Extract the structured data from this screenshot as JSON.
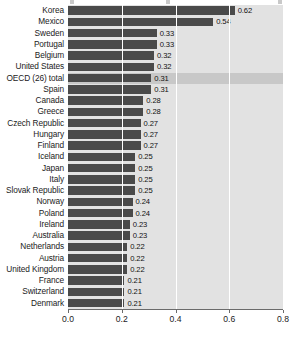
{
  "chart_data": {
    "type": "bar",
    "orientation": "horizontal",
    "title": "",
    "xlabel": "",
    "ylabel": "",
    "xlim": [
      0.0,
      0.8
    ],
    "xticks": [
      "0.0",
      "0.2",
      "0.4",
      "0.6",
      "0.8"
    ],
    "xtick_values": [
      0.0,
      0.2,
      0.4,
      0.6,
      0.8
    ],
    "grid": true,
    "legend": "none",
    "highlight_category": "OECD (26) total",
    "categories": [
      "Korea",
      "Mexico",
      "Sweden",
      "Portugal",
      "Belgium",
      "United States",
      "OECD (26) total",
      "Spain",
      "Canada",
      "Greece",
      "Czech Republic",
      "Hungary",
      "Finland",
      "Iceland",
      "Japan",
      "Italy",
      "Slovak Republic",
      "Norway",
      "Poland",
      "Ireland",
      "Australia",
      "Netherlands",
      "Austria",
      "United Kingdom",
      "France",
      "Switzerland",
      "Denmark"
    ],
    "values": [
      0.62,
      0.54,
      0.33,
      0.33,
      0.32,
      0.32,
      0.31,
      0.31,
      0.28,
      0.28,
      0.27,
      0.27,
      0.27,
      0.25,
      0.25,
      0.25,
      0.25,
      0.24,
      0.24,
      0.23,
      0.23,
      0.22,
      0.22,
      0.22,
      0.21,
      0.21,
      0.21
    ],
    "value_labels": [
      "0.62",
      "0.54",
      "0.33",
      "0.33",
      "0.32",
      "0.32",
      "0.31",
      "0.31",
      "0.28",
      "0.28",
      "0.27",
      "0.27",
      "0.27",
      "0.25",
      "0.25",
      "0.25",
      "0.25",
      "0.24",
      "0.24",
      "0.23",
      "0.23",
      "0.22",
      "0.22",
      "0.22",
      "0.21",
      "0.21",
      "0.21"
    ],
    "colors": {
      "bar": "#4a4a4a",
      "plot_background": "#e2e2e2",
      "highlight_row": "#c8c8c8",
      "gridline": "#ffffff",
      "axis": "#6b6b6b",
      "text": "#1b1b1b"
    }
  }
}
